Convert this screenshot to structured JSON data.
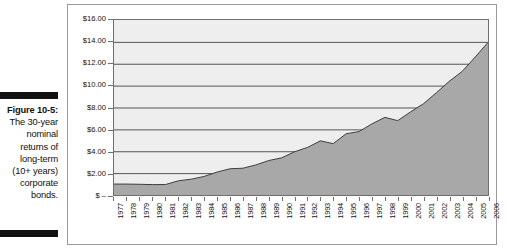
{
  "caption": {
    "figure_label": "Figure 10-5:",
    "lines": [
      "The 30-year",
      "nominal",
      "returns of",
      "long-term",
      "(10+ years)",
      "corporate",
      "bonds."
    ],
    "full_text": "Figure 10-5: The 30-year nominal returns of long-term (10+ years) corporate bonds."
  },
  "colors": {
    "area_fill": "#a8a8a8",
    "plot_background": "#eeeeee",
    "gridline": "#555555",
    "border": "#6f6f6f",
    "frame": "#9a9a9a",
    "rule": "#111111",
    "text": "#111111"
  },
  "chart_data": {
    "type": "area",
    "title": "",
    "subtitle": "",
    "xlabel": "",
    "ylabel": "",
    "grid": true,
    "legend": "none",
    "ylim": [
      0,
      16
    ],
    "ytick_labels": [
      "$16.00",
      "$14.00",
      "$12.00",
      "$10.00",
      "$8.00",
      "$6.00",
      "$4.00",
      "$2.00",
      "$ –"
    ],
    "ytick_values": [
      16,
      14,
      12,
      10,
      8,
      6,
      4,
      2,
      0
    ],
    "categories": [
      "1977",
      "1978",
      "1979",
      "1980",
      "1981",
      "1982",
      "1983",
      "1984",
      "1985",
      "1986",
      "1987",
      "1988",
      "1989",
      "1990",
      "1991",
      "1992",
      "1993",
      "1994",
      "1995",
      "1996",
      "1997",
      "1998",
      "1999",
      "2000",
      "2001",
      "2002",
      "2003",
      "2004",
      "2005",
      "2006"
    ],
    "values": [
      1.0,
      1.0,
      0.98,
      0.95,
      0.96,
      1.3,
      1.45,
      1.7,
      2.1,
      2.4,
      2.45,
      2.75,
      3.15,
      3.4,
      3.95,
      4.35,
      4.95,
      4.7,
      5.6,
      5.8,
      6.5,
      7.1,
      6.8,
      7.6,
      8.35,
      9.35,
      10.4,
      11.3,
      12.6,
      13.95
    ],
    "series": [
      {
        "name": "Long-term (10+ years) corporate bonds",
        "values": [
          1.0,
          1.0,
          0.98,
          0.95,
          0.96,
          1.3,
          1.45,
          1.7,
          2.1,
          2.4,
          2.45,
          2.75,
          3.15,
          3.4,
          3.95,
          4.35,
          4.95,
          4.7,
          5.6,
          5.8,
          6.5,
          7.1,
          6.8,
          7.6,
          8.35,
          9.35,
          10.4,
          11.3,
          12.6,
          13.95
        ]
      }
    ]
  }
}
